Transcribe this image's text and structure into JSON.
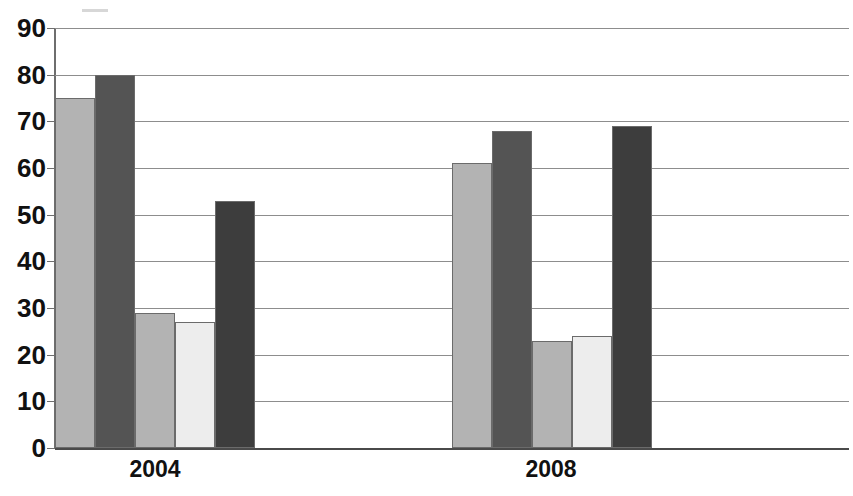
{
  "chart_data": {
    "type": "bar",
    "title": "",
    "xlabel": "",
    "ylabel": "",
    "categories": [
      "2004",
      "2008"
    ],
    "ylim": [
      0,
      90
    ],
    "ytick_step": 10,
    "yticks": [
      90,
      80,
      70,
      60,
      50,
      40,
      30,
      20,
      10,
      0
    ],
    "grid": true,
    "legend_position": "top",
    "series": [
      {
        "name": "Series 1",
        "color": "#b3b3b3",
        "values": [
          75,
          61
        ]
      },
      {
        "name": "Series 2",
        "color": "#545454",
        "values": [
          80,
          68
        ]
      },
      {
        "name": "Series 3",
        "color": "#b3b3b3",
        "values": [
          29,
          23
        ]
      },
      {
        "name": "Series 4",
        "color": "#ededed",
        "values": [
          27,
          24
        ]
      },
      {
        "name": "Series 5",
        "color": "#3d3d3d",
        "values": [
          53,
          69
        ]
      }
    ],
    "bars": [
      {
        "group": "2004",
        "series": "Series 1",
        "value": 75,
        "color": "#b3b3b3"
      },
      {
        "group": "2004",
        "series": "Series 2",
        "value": 80,
        "color": "#545454"
      },
      {
        "group": "2004",
        "series": "Series 3",
        "value": 29,
        "color": "#b3b3b3"
      },
      {
        "group": "2004",
        "series": "Series 4",
        "value": 27,
        "color": "#ededed"
      },
      {
        "group": "2004",
        "series": "Series 5",
        "value": 53,
        "color": "#3d3d3d"
      },
      {
        "group": "2008",
        "series": "Series 1",
        "value": 61,
        "color": "#b3b3b3"
      },
      {
        "group": "2008",
        "series": "Series 2",
        "value": 68,
        "color": "#545454"
      },
      {
        "group": "2008",
        "series": "Series 3",
        "value": 23,
        "color": "#b3b3b3"
      },
      {
        "group": "2008",
        "series": "Series 4",
        "value": 24,
        "color": "#ededed"
      },
      {
        "group": "2008",
        "series": "Series 5",
        "value": 69,
        "color": "#3d3d3d"
      }
    ]
  },
  "layout": {
    "plot_left": 55,
    "plot_top": 28,
    "plot_width": 794,
    "plot_height": 420,
    "group_starts": [
      55,
      452
    ],
    "bar_width": 40,
    "gridline_color": "#8d8d8d",
    "axis_color": "#6e6e6e",
    "bar_border_color": "#6b6b6b"
  },
  "title_strip": {
    "text": "",
    "note": "title cropped off top edge of screenshot"
  },
  "xlabels": [
    {
      "text": "2004",
      "center": 155
    },
    {
      "text": "2008",
      "center": 551
    }
  ]
}
